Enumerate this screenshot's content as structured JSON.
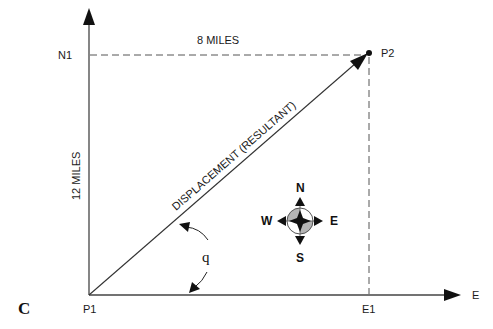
{
  "figure": {
    "panel_label": "C",
    "points": {
      "origin": "P1",
      "endpoint": "P2",
      "north_projection": "N1",
      "east_projection": "E1"
    },
    "axes": {
      "x_axis_label": "E",
      "y_axis_label": ""
    },
    "measurements": {
      "horizontal": "8 MILES",
      "vertical": "12 MILES"
    },
    "vector_label": "DISPLACEMENT (RESULTANT)",
    "angle_symbol": "q",
    "compass": {
      "north": "N",
      "south": "S",
      "east": "E",
      "west": "W",
      "shade_color": "#b5b5b5"
    },
    "colors": {
      "line": "#333333",
      "text": "#1a1a1a",
      "background": "#ffffff"
    }
  }
}
